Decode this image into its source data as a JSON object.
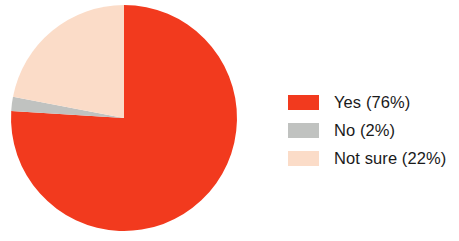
{
  "chart_data": {
    "type": "pie",
    "title": "",
    "subtitle": "",
    "xlabel": "",
    "ylabel": "",
    "grid": false,
    "legend_position": "right",
    "start_angle_deg": 0,
    "direction": "clockwise",
    "categories": [
      "Yes",
      "No",
      "Not sure"
    ],
    "values": [
      76,
      2,
      22
    ],
    "value_unit": "%",
    "colors": [
      "#F23A1E",
      "#C0C2C0",
      "#FBDCC8"
    ],
    "slices": [
      {
        "label": "Yes",
        "value": 76,
        "display": "Yes (76%)",
        "color": "#F23A1E"
      },
      {
        "label": "No",
        "value": 2,
        "display": "No (2%)",
        "color": "#C0C2C0"
      },
      {
        "label": "Not sure",
        "value": 22,
        "display": "Not sure (22%)",
        "color": "#FBDCC8"
      }
    ],
    "legend_entries": [
      "Yes (76%)",
      "No (2%)",
      "Not sure (22%)"
    ]
  },
  "legend": {
    "items": [
      {
        "label": "Yes (76%)",
        "color": "#F23A1E",
        "swatch_name": "legend-swatch-yes"
      },
      {
        "label": "No (2%)",
        "color": "#C0C2C0",
        "swatch_name": "legend-swatch-no"
      },
      {
        "label": "Not sure (22%)",
        "color": "#FBDCC8",
        "swatch_name": "legend-swatch-not-sure"
      }
    ]
  }
}
